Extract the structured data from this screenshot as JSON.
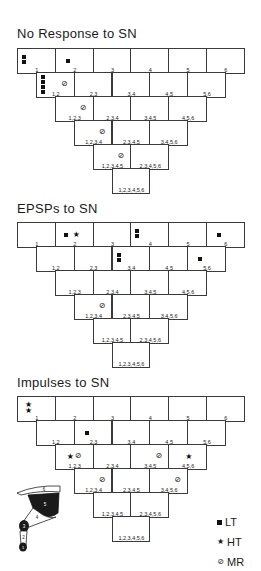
{
  "sections": [
    {
      "title": "No Response to SN",
      "top": 48,
      "title_top": 26,
      "rows": [
        {
          "labels": [
            "1",
            "2",
            "3",
            "4",
            "5",
            "6"
          ]
        },
        {
          "labels": [
            "1,2",
            "2,3",
            "3,4",
            "4,5",
            "5,6"
          ]
        },
        {
          "labels": [
            "1,2,3",
            "2,3,4",
            "3,4,5",
            "4,5,6"
          ]
        },
        {
          "labels": [
            "1,2,3,4",
            "2,3,4,5",
            "3,4,5,6"
          ]
        },
        {
          "labels": [
            "1,2,3,4,5",
            "2,3,4,5,6"
          ]
        },
        {
          "labels": [
            "1,2,3,4,5,6"
          ]
        }
      ],
      "markers": [
        {
          "row": 0,
          "col": 0,
          "LT": 2,
          "HT": 0,
          "MR": 0
        },
        {
          "row": 0,
          "col": 1,
          "LT": 1,
          "HT": 0,
          "MR": 0
        },
        {
          "row": 1,
          "col": 0,
          "LT": 4,
          "HT": 0,
          "MR": 1
        },
        {
          "row": 2,
          "col": 0,
          "LT": 0,
          "HT": 0,
          "MR": 1
        },
        {
          "row": 3,
          "col": 0,
          "LT": 0,
          "HT": 0,
          "MR": 1
        },
        {
          "row": 4,
          "col": 0,
          "LT": 0,
          "HT": 0,
          "MR": 1
        }
      ]
    },
    {
      "title": "EPSPs to SN",
      "top": 222,
      "title_top": 201,
      "rows": [
        {
          "labels": [
            "1",
            "2",
            "3",
            "4",
            "5",
            "6"
          ]
        },
        {
          "labels": [
            "1,2",
            "2,3",
            "3,4",
            "4,5",
            "5,6"
          ]
        },
        {
          "labels": [
            "1,2,3",
            "2,3,4",
            "3,4,5",
            "4,5,6"
          ]
        },
        {
          "labels": [
            "1,2,3,4",
            "2,3,4,5",
            "3,4,5,6"
          ]
        },
        {
          "labels": [
            "1,2,3,4,5",
            "2,3,4,5,6"
          ]
        },
        {
          "labels": [
            "1,2,3,4,5,6"
          ]
        }
      ],
      "markers": [
        {
          "row": 0,
          "col": 1,
          "LT": 1,
          "HT": 1,
          "MR": 0
        },
        {
          "row": 0,
          "col": 3,
          "LT": 2,
          "HT": 0,
          "MR": 0
        },
        {
          "row": 0,
          "col": 5,
          "LT": 1,
          "HT": 0,
          "MR": 0
        },
        {
          "row": 1,
          "col": 2,
          "LT": 2,
          "HT": 0,
          "MR": 0
        },
        {
          "row": 1,
          "col": 4,
          "LT": 1,
          "HT": 0,
          "MR": 0
        },
        {
          "row": 3,
          "col": 0,
          "LT": 0,
          "HT": 0,
          "MR": 1
        }
      ]
    },
    {
      "title": "Impulses to SN",
      "top": 396,
      "title_top": 375,
      "rows": [
        {
          "labels": [
            "1",
            "2",
            "3",
            "4",
            "5",
            "6"
          ]
        },
        {
          "labels": [
            "1,2",
            "2,3",
            "3,4",
            "4,5",
            "5,6"
          ]
        },
        {
          "labels": [
            "1,2,3",
            "2,3,4",
            "3,4,5",
            "4,5,6"
          ]
        },
        {
          "labels": [
            "1,2,3,4",
            "2,3,4,5",
            "3,4,5,6"
          ]
        },
        {
          "labels": [
            "1,2,3,4,5",
            "2,3,4,5,6"
          ]
        },
        {
          "labels": [
            "1,2,3,4,5,6"
          ]
        }
      ],
      "markers": [
        {
          "row": 0,
          "col": 0,
          "LT": 0,
          "HT": 2,
          "MR": 0
        },
        {
          "row": 1,
          "col": 1,
          "LT": 1,
          "HT": 0,
          "MR": 0
        },
        {
          "row": 2,
          "col": 0,
          "LT": 0,
          "HT": 1,
          "MR": 1
        },
        {
          "row": 2,
          "col": 2,
          "LT": 0,
          "HT": 0,
          "MR": 1
        },
        {
          "row": 2,
          "col": 3,
          "LT": 0,
          "HT": 1,
          "MR": 0
        },
        {
          "row": 3,
          "col": 0,
          "LT": 0,
          "HT": 0,
          "MR": 1
        },
        {
          "row": 3,
          "col": 2,
          "LT": 0,
          "HT": 0,
          "MR": 1
        }
      ]
    }
  ],
  "legend": [
    {
      "symbol": "square",
      "label": "LT"
    },
    {
      "symbol": "star",
      "label": "HT"
    },
    {
      "symbol": "slashed-circle",
      "label": "MR"
    }
  ],
  "limb_diagram": {
    "segment_labels": [
      "1",
      "2",
      "3",
      "4",
      "5",
      "6"
    ]
  },
  "glyphs": {
    "star": "★",
    "mr": "⊘"
  }
}
